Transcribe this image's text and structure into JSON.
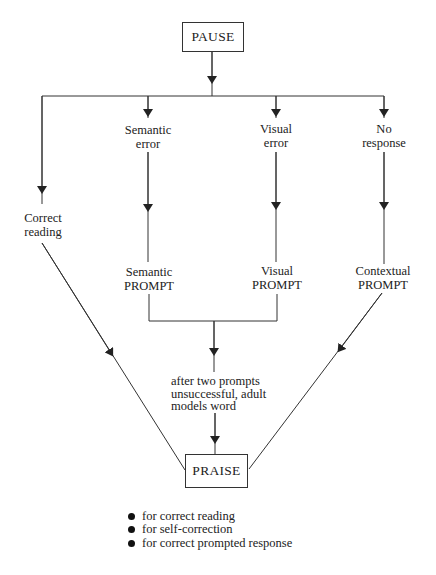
{
  "diagram": {
    "start_node": "PAUSE",
    "end_node": "PRAISE",
    "branches": [
      {
        "id": "correct",
        "label_line1": "Correct",
        "label_line2": "reading"
      },
      {
        "id": "semantic",
        "label_line1": "Semantic",
        "label_line2": "error",
        "prompt_line1": "Semantic",
        "prompt_line2": "PROMPT"
      },
      {
        "id": "visual",
        "label_line1": "Visual",
        "label_line2": "error",
        "prompt_line1": "Visual",
        "prompt_line2": "PROMPT"
      },
      {
        "id": "no_response",
        "label_line1": "No",
        "label_line2": "response",
        "prompt_line1": "Contextual",
        "prompt_line2": "PROMPT"
      }
    ],
    "fallback_note": {
      "line1": "after two prompts",
      "line2": "unsuccessful, adult",
      "line3": "models word"
    },
    "praise_reasons": [
      "for correct reading",
      "for self-correction",
      "for correct prompted response"
    ]
  }
}
